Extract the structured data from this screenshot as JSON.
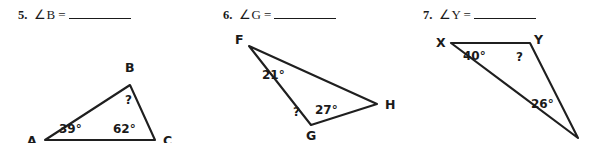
{
  "page": {
    "background_color": "#ffffff",
    "ink_color": "#1a1a1a",
    "type": "geometry-worksheet-triangle-angle-sum"
  },
  "problems": [
    {
      "number": "5.",
      "expression": "∠B =",
      "answer_value": "",
      "figure": {
        "shape": "triangle",
        "vertices": [
          {
            "name": "A",
            "label": "A",
            "x": 45,
            "y": 112
          },
          {
            "name": "B",
            "label": "B",
            "x": 130,
            "y": 57
          },
          {
            "name": "C",
            "label": "C",
            "x": 155,
            "y": 112
          }
        ],
        "angles": [
          {
            "at": "A",
            "label": "39°",
            "value": 39,
            "known": true
          },
          {
            "at": "B",
            "label": "?",
            "value": null,
            "known": false
          },
          {
            "at": "C",
            "label": "62°",
            "value": 62,
            "known": true
          }
        ]
      }
    },
    {
      "number": "6.",
      "expression": "∠G =",
      "answer_value": "",
      "figure": {
        "shape": "triangle",
        "vertices": [
          {
            "name": "F",
            "label": "F",
            "x": 44,
            "y": 18
          },
          {
            "name": "G",
            "label": "G",
            "x": 106,
            "y": 97
          },
          {
            "name": "H",
            "label": "H",
            "x": 172,
            "y": 76
          }
        ],
        "angles": [
          {
            "at": "F",
            "label": "21°",
            "value": 21,
            "known": true
          },
          {
            "at": "G",
            "label": "?",
            "value": null,
            "known": false
          },
          {
            "at": "H",
            "label": "27°",
            "value": 27,
            "known": true
          }
        ]
      }
    },
    {
      "number": "7.",
      "expression": "∠Y =",
      "answer_value": "",
      "figure": {
        "shape": "triangle",
        "vertices": [
          {
            "name": "X",
            "label": "X",
            "x": 46,
            "y": 15
          },
          {
            "name": "Y",
            "label": "Y",
            "x": 125,
            "y": 15
          },
          {
            "name": "Z",
            "label": "",
            "x": 173,
            "y": 110
          }
        ],
        "angles": [
          {
            "at": "X",
            "label": "40°",
            "value": 40,
            "known": true
          },
          {
            "at": "Y",
            "label": "?",
            "value": null,
            "known": false
          },
          {
            "at": "Z",
            "label": "26°",
            "value": 26,
            "known": true
          }
        ]
      }
    }
  ]
}
